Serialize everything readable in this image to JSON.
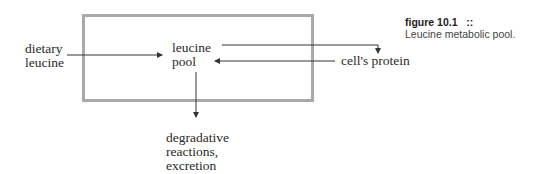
{
  "diagram": {
    "nodes": {
      "dietary": [
        "dietary",
        "leucine"
      ],
      "pool": [
        "leucine",
        "pool"
      ],
      "protein": "cell's protein",
      "degradation": [
        "degradative",
        "reactions,",
        "excretion"
      ]
    },
    "edges": [
      {
        "from": "dietary leucine",
        "to": "leucine pool"
      },
      {
        "from": "leucine pool",
        "to": "cell's protein"
      },
      {
        "from": "cell's protein",
        "to": "leucine pool"
      },
      {
        "from": "leucine pool",
        "to": "degradative reactions, excretion"
      }
    ]
  },
  "caption": {
    "label": "figure 10.1",
    "separator": "::",
    "text": "Leucine metabolic pool."
  },
  "colors": {
    "box_border": "#a9a9a9",
    "line": "#333333"
  }
}
